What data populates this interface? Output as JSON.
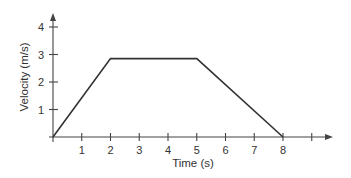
{
  "chart_data": {
    "type": "line",
    "title": "",
    "xlabel": "Time (s)",
    "ylabel": "Velocity (m/s)",
    "x_ticks": [
      1,
      2,
      3,
      4,
      5,
      6,
      7,
      8
    ],
    "x_tick_labels": [
      "1",
      "2",
      "3",
      "4",
      "5",
      "6",
      "7",
      "8"
    ],
    "x_extra_unlabeled_tick": 9,
    "y_ticks": [
      1,
      2,
      3,
      4
    ],
    "y_tick_labels": [
      "1",
      "2",
      "3",
      "4"
    ],
    "xlim": [
      0,
      9.7
    ],
    "ylim": [
      0,
      4.5
    ],
    "grid": false,
    "legend": null,
    "series": [
      {
        "name": "velocity",
        "x": [
          0,
          2,
          5,
          8
        ],
        "y": [
          0,
          2.85,
          2.85,
          0
        ]
      }
    ],
    "colors": {
      "line": "#333333",
      "axis": "#444444",
      "text": "#333333"
    }
  }
}
